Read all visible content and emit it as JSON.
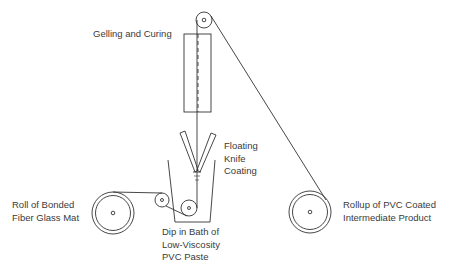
{
  "diagram": {
    "labels": {
      "gelling": "Gelling and Curing",
      "knife": [
        "Floating",
        "Knife",
        "Coating"
      ],
      "roll_in": [
        "Roll of Bonded",
        "Fiber Glass Mat"
      ],
      "bath": [
        "Dip in Bath of",
        "Low-Viscosity",
        "PVC Paste"
      ],
      "rollup": [
        "Rollup of PVC Coated",
        "Intermediate Product"
      ]
    },
    "components": [
      {
        "id": "supply-roll",
        "label": "Roll of Bonded Fiber Glass Mat"
      },
      {
        "id": "guide-roller",
        "label": ""
      },
      {
        "id": "dip-bath",
        "label": "Dip in Bath of Low-Viscosity PVC Paste"
      },
      {
        "id": "floating-knife",
        "label": "Floating Knife Coating"
      },
      {
        "id": "gelling-oven",
        "label": "Gelling and Curing"
      },
      {
        "id": "top-roller",
        "label": ""
      },
      {
        "id": "rollup-roll",
        "label": "Rollup of PVC Coated Intermediate Product"
      }
    ],
    "colors": {
      "line": "#333333",
      "text": "#3a3a3a"
    }
  }
}
